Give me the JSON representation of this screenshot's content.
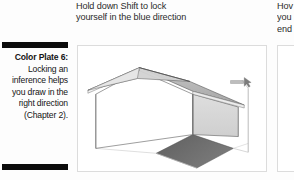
{
  "figure": {
    "caption": {
      "lead": "Color Plate 6:",
      "body": "Locking an inference helps you draw in the right direction (Chapter 2).",
      "rule_color": "#0b0b0b"
    },
    "heading": {
      "lines": [
        "Hold down Shift to lock",
        "yourself in the blue direction"
      ]
    },
    "heading_right": {
      "lines": [
        "Hov",
        "you",
        "end"
      ]
    },
    "panel": {
      "background": "#ffffff",
      "border_color": "#dcdcdc"
    },
    "scene": {
      "name": "sketchup-house-model",
      "description": "3D house model drawn in SketchUp with a pitched gable roof, white front gable wall, light gray side wall, and a dark gray ground shadow. A magenta inference line runs vertically at the right with a small tooltip near the cursor.",
      "colors": {
        "roof": "#b8b8b8",
        "roof_edge": "#e2e2e2",
        "gable_wall": "#ffffff",
        "side_wall": "#d8d8d8",
        "ground_shadow": "#6d6d6d",
        "ground_plane": "#fbfbfb",
        "outline": "#4d4d4d",
        "inference_line": "#b0b0b0",
        "tooltip": "#9a9a9a"
      }
    }
  }
}
